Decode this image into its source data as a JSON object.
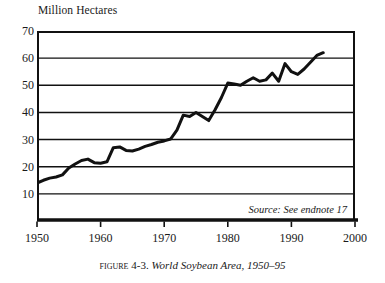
{
  "chart_data": {
    "type": "line",
    "figure_label": "Figure",
    "figure_number": "4-3.",
    "caption_title": "World Soybean Area, 1950–95",
    "ylabel": "Million Hectares",
    "xlabel": "",
    "source_note": "Source: See endnote 17",
    "xlim": [
      1950,
      2000
    ],
    "ylim": [
      0,
      70
    ],
    "yticks": [
      10,
      20,
      30,
      40,
      50,
      60,
      70
    ],
    "xticks": [
      1950,
      1960,
      1970,
      1980,
      1990,
      2000
    ],
    "grid": "horizontal",
    "legend": "none",
    "line_color": "#111111",
    "series": [
      {
        "name": "World Soybean Area",
        "x": [
          1950,
          1951,
          1952,
          1953,
          1954,
          1955,
          1956,
          1957,
          1958,
          1959,
          1960,
          1961,
          1962,
          1963,
          1964,
          1965,
          1966,
          1967,
          1968,
          1969,
          1970,
          1971,
          1972,
          1973,
          1974,
          1975,
          1976,
          1977,
          1978,
          1979,
          1980,
          1981,
          1982,
          1983,
          1984,
          1985,
          1986,
          1987,
          1988,
          1989,
          1990,
          1991,
          1992,
          1993,
          1994,
          1995
        ],
        "values": [
          14.0,
          15.0,
          15.8,
          16.2,
          17.0,
          19.5,
          21.0,
          22.3,
          22.8,
          21.5,
          21.3,
          21.8,
          27.0,
          27.3,
          26.0,
          25.8,
          26.5,
          27.5,
          28.2,
          29.0,
          29.5,
          30.2,
          33.5,
          39.0,
          38.5,
          40.0,
          38.5,
          37.0,
          41.0,
          45.5,
          50.8,
          50.5,
          50.0,
          51.5,
          52.8,
          51.5,
          52.0,
          54.5,
          51.5,
          58.0,
          55.0,
          54.0,
          56.0,
          58.5,
          61.0,
          62.0
        ]
      }
    ]
  }
}
